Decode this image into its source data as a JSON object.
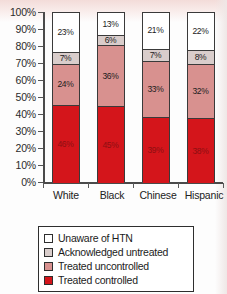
{
  "chart_data": {
    "type": "bar",
    "subtype": "stacked-100-percent",
    "title": "",
    "xlabel": "",
    "ylabel": "",
    "ylim": [
      0,
      100
    ],
    "yticks": [
      "0%",
      "10%",
      "20%",
      "30%",
      "40%",
      "50%",
      "60%",
      "70%",
      "80%",
      "90%",
      "100%"
    ],
    "grid": false,
    "legend_position": "bottom",
    "categories": [
      "White",
      "Black",
      "Chinese",
      "Hispanic"
    ],
    "series": [
      {
        "name": "Unaware of HTN",
        "color": "#ffffff",
        "values": [
          23,
          13,
          21,
          22
        ],
        "labels": [
          "23%",
          "13%",
          "21%",
          "22%"
        ]
      },
      {
        "name": "Acknowledged untreated",
        "color": "#d9cdcb",
        "values": [
          7,
          6,
          7,
          8
        ],
        "labels": [
          "7%",
          "6%",
          "7%",
          "8%"
        ]
      },
      {
        "name": "Treated uncontrolled",
        "color": "#d8918f",
        "values": [
          24,
          36,
          33,
          32
        ],
        "labels": [
          "24%",
          "36%",
          "33%",
          "32%"
        ]
      },
      {
        "name": "Treated controlled",
        "color": "#d4151b",
        "values": [
          46,
          45,
          39,
          38
        ],
        "labels": [
          "46%",
          "45%",
          "39%",
          "38%"
        ]
      }
    ]
  },
  "axis": {
    "yticks": [
      {
        "label": "100%",
        "value": 100
      },
      {
        "label": "90%",
        "value": 90
      },
      {
        "label": "80%",
        "value": 80
      },
      {
        "label": "70%",
        "value": 70
      },
      {
        "label": "60%",
        "value": 60
      },
      {
        "label": "50%",
        "value": 50
      },
      {
        "label": "40%",
        "value": 40
      },
      {
        "label": "30%",
        "value": 30
      },
      {
        "label": "20%",
        "value": 20
      },
      {
        "label": "10%",
        "value": 10
      },
      {
        "label": "0%",
        "value": 0
      }
    ]
  },
  "legend": {
    "items": [
      {
        "label": "Unaware of HTN",
        "swatch": "sw-unaware"
      },
      {
        "label": "Acknowledged untreated",
        "swatch": "sw-acknowledged"
      },
      {
        "label": "Treated uncontrolled",
        "swatch": "sw-uncontrolled"
      },
      {
        "label": "Treated controlled",
        "swatch": "sw-controlled"
      }
    ]
  },
  "colors": {
    "unaware": "#ffffff",
    "acknowledged": "#d9cdcb",
    "uncontrolled": "#d8918f",
    "controlled": "#d4151b",
    "axis": "#4a4a4a",
    "text": "#1c1c1c"
  }
}
